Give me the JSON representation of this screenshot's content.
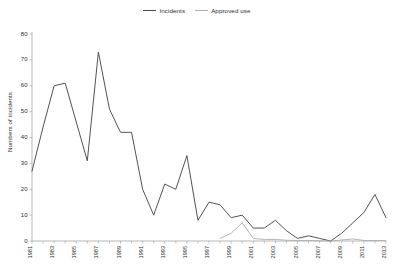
{
  "chart_data": {
    "type": "line",
    "title": "",
    "xlabel": "",
    "ylabel": "Numbers of incidents",
    "ylim": [
      0,
      80
    ],
    "ytick_step": 10,
    "yticks": [
      0,
      10,
      20,
      30,
      40,
      50,
      60,
      70,
      80
    ],
    "grid": false,
    "legend_position": "top-center",
    "x": [
      1981,
      1982,
      1983,
      1984,
      1985,
      1986,
      1987,
      1988,
      1989,
      1990,
      1991,
      1992,
      1993,
      1994,
      1995,
      1996,
      1997,
      1998,
      1999,
      2000,
      2001,
      2002,
      2003,
      2004,
      2005,
      2006,
      2007,
      2008,
      2009,
      2010,
      2011,
      2012,
      2013
    ],
    "xtick_labels": [
      "1981",
      "1983",
      "1985",
      "1987",
      "1989",
      "1991",
      "1993",
      "1995",
      "1997",
      "1999",
      "2001",
      "2003",
      "2005",
      "2007",
      "2009",
      "2011",
      "2013"
    ],
    "series": [
      {
        "name": "Incidents",
        "color": "#4a4a4a",
        "values": [
          27,
          44,
          60,
          61,
          46,
          31,
          73,
          51,
          42,
          42,
          20,
          10,
          22,
          20,
          33,
          8,
          15,
          14,
          9,
          10,
          5,
          5,
          8,
          4,
          1,
          2,
          1,
          0,
          3,
          7,
          11,
          18,
          9
        ]
      },
      {
        "name": "Approved use",
        "color": "#b0b0b0",
        "values": [
          null,
          null,
          null,
          null,
          null,
          null,
          null,
          null,
          null,
          null,
          null,
          null,
          null,
          null,
          null,
          null,
          null,
          1,
          3,
          7,
          1,
          0.6,
          0.6,
          0.3,
          0.2,
          0.2,
          0.1,
          0,
          0.4,
          0.8,
          0.2,
          0.2,
          0.2
        ]
      }
    ]
  },
  "legend": {
    "entries": [
      {
        "label": "Incidents"
      },
      {
        "label": "Approved use"
      }
    ]
  },
  "axes": {
    "y_title": "Numbers of incidents"
  }
}
